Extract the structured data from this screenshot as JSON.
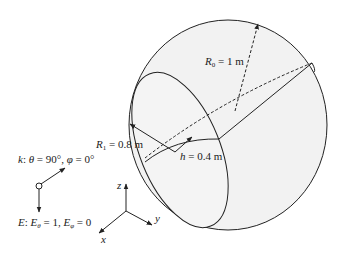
{
  "figure": {
    "labels": {
      "r0": {
        "symbol": "R",
        "sub": "0",
        "text": " = 1 m"
      },
      "r1": {
        "symbol": "R",
        "sub": "1",
        "text": " = 0.8 m"
      },
      "h": {
        "symbol": "h",
        "text": " = 0.4 m"
      },
      "k": {
        "symbol": "k",
        "text": ": ",
        "theta": "θ",
        "theta_val": " = 90°, ",
        "phi": "φ",
        "phi_val": " = 0°"
      },
      "e": {
        "symbol": "E",
        "text": ": ",
        "etheta": "E",
        "etheta_sub": "θ",
        "etheta_val": " = 1, ",
        "ephi": "E",
        "ephi_sub": "φ",
        "ephi_val": " = 0"
      },
      "axis_x": "x",
      "axis_y": "y",
      "axis_z": "z"
    },
    "colors": {
      "stroke": "#222222",
      "fill": "#f2f2f2",
      "background": "#ffffff"
    }
  }
}
